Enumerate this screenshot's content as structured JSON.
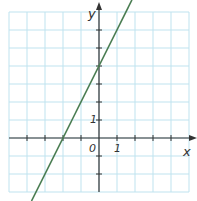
{
  "chart_data": {
    "type": "line",
    "title": "",
    "xlabel": "x",
    "ylabel": "y",
    "xlim": [
      -5,
      5
    ],
    "ylim": [
      -3,
      7
    ],
    "grid": true,
    "tick_labels": {
      "x": [
        "1"
      ],
      "y": [
        "1"
      ],
      "origin": "0"
    },
    "series": [
      {
        "name": "y = 2x + 4",
        "slope": 2,
        "intercept": 4,
        "x": [
          -3.75,
          1.83
        ],
        "y": [
          -3.5,
          7.67
        ]
      }
    ],
    "colors": {
      "grid": "#bfe3ef",
      "axis": "#333333",
      "line": "#4a7d52"
    }
  }
}
